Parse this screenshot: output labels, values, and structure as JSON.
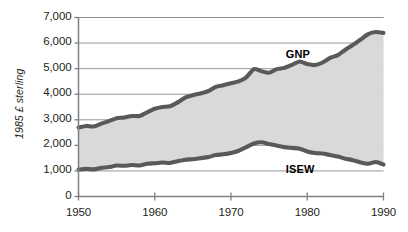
{
  "chart_data": {
    "type": "area",
    "title": "",
    "xlabel": "",
    "ylabel": "1985 £ sterling",
    "xlim": [
      1950,
      1990
    ],
    "ylim": [
      0,
      7000
    ],
    "xticks": [
      "1950",
      "1960",
      "1970",
      "1980",
      "1990"
    ],
    "xtick_values": [
      1950,
      1960,
      1970,
      1980,
      1990
    ],
    "yticks": [
      "0",
      "1,000",
      "2,000",
      "3,000",
      "4,000",
      "5,000",
      "6,000",
      "7,000"
    ],
    "ytick_values": [
      0,
      1000,
      2000,
      3000,
      4000,
      5000,
      6000,
      7000
    ],
    "grid": true,
    "legend_position": "inline-annotation",
    "fill_between": true,
    "fill_color": "#d9d9d9",
    "line_color": "#595959",
    "axis_color": "#808080",
    "x": [
      1950,
      1951,
      1952,
      1953,
      1954,
      1955,
      1956,
      1957,
      1958,
      1959,
      1960,
      1961,
      1962,
      1963,
      1964,
      1965,
      1966,
      1967,
      1968,
      1969,
      1970,
      1971,
      1972,
      1973,
      1974,
      1975,
      1976,
      1977,
      1978,
      1979,
      1980,
      1981,
      1982,
      1983,
      1984,
      1985,
      1986,
      1987,
      1988,
      1989,
      1990
    ],
    "series": [
      {
        "name": "GNP",
        "label": "GNP",
        "values": [
          2700,
          2760,
          2740,
          2850,
          2950,
          3060,
          3090,
          3150,
          3150,
          3290,
          3430,
          3500,
          3530,
          3680,
          3870,
          3960,
          4030,
          4120,
          4290,
          4350,
          4430,
          4500,
          4660,
          4980,
          4900,
          4840,
          4980,
          5030,
          5150,
          5280,
          5180,
          5140,
          5240,
          5420,
          5530,
          5740,
          5930,
          6140,
          6350,
          6430,
          6400
        ]
      },
      {
        "name": "ISEW",
        "label": "ISEW",
        "values": [
          1050,
          1080,
          1060,
          1120,
          1150,
          1210,
          1200,
          1230,
          1210,
          1280,
          1300,
          1330,
          1310,
          1380,
          1440,
          1460,
          1500,
          1540,
          1620,
          1650,
          1700,
          1790,
          1930,
          2070,
          2120,
          2050,
          1990,
          1930,
          1900,
          1870,
          1760,
          1700,
          1680,
          1620,
          1560,
          1480,
          1420,
          1330,
          1280,
          1350,
          1250
        ]
      }
    ],
    "annotations": [
      {
        "text": "GNP",
        "x": 1979,
        "y": 5550
      },
      {
        "text": "ISEW",
        "x": 1979,
        "y": 1050
      }
    ]
  }
}
